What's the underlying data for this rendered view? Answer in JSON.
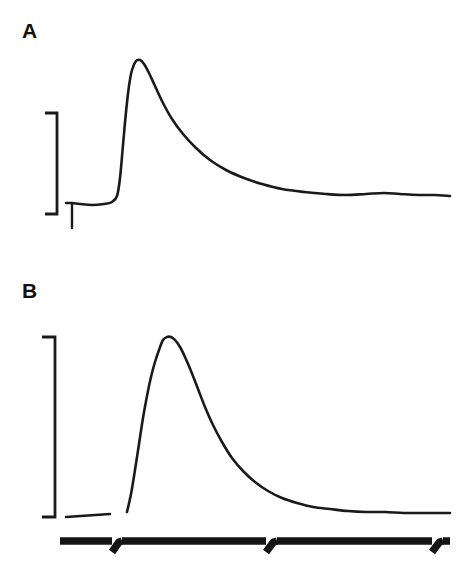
{
  "figure": {
    "background_color": "#ffffff",
    "ink_color": "#1a1a1a",
    "width": 469,
    "height": 575,
    "panel_a_label": "A",
    "panel_b_label": "B"
  },
  "chart_data": {
    "type": "line",
    "title": "",
    "subtitle": "",
    "xlabel": "",
    "ylabel": "",
    "grid": false,
    "legend_position": "none",
    "axis_visible": false,
    "xlim": [
      0,
      469
    ],
    "ylim": [
      0,
      575
    ],
    "panels": [
      {
        "name": "A",
        "label": "A",
        "label_x": 22,
        "label_y": 38,
        "baseline_y": 203,
        "peak_x": 137,
        "peak_y": 60,
        "rise_start_x": 118,
        "trace_start_x": 66,
        "trace_end_x": 450,
        "plateau_y": 197,
        "peak_amplitude_px": 143,
        "has_stimulus_artifact": true,
        "stimulus_artifact_x": 72,
        "stimulus_artifact_bottom_y": 228,
        "calibration_bracket": {
          "stem_x": 57,
          "top_y": 113,
          "bottom_y": 214,
          "tick_length": 12,
          "height_px": 101,
          "orientation": "right-facing"
        },
        "points": [
          [
            66,
            203
          ],
          [
            72,
            203
          ],
          [
            80,
            204
          ],
          [
            92,
            205
          ],
          [
            104,
            204
          ],
          [
            112,
            202
          ],
          [
            117,
            196
          ],
          [
            120,
            178
          ],
          [
            123,
            145
          ],
          [
            126,
            112
          ],
          [
            129,
            86
          ],
          [
            132,
            70
          ],
          [
            136,
            61
          ],
          [
            140,
            60
          ],
          [
            144,
            64
          ],
          [
            149,
            73
          ],
          [
            155,
            86
          ],
          [
            163,
            103
          ],
          [
            172,
            119
          ],
          [
            183,
            134
          ],
          [
            196,
            148
          ],
          [
            210,
            160
          ],
          [
            226,
            170
          ],
          [
            244,
            178
          ],
          [
            262,
            184
          ],
          [
            282,
            189
          ],
          [
            304,
            192
          ],
          [
            326,
            194
          ],
          [
            346,
            195
          ],
          [
            366,
            194
          ],
          [
            384,
            193
          ],
          [
            400,
            194
          ],
          [
            418,
            195
          ],
          [
            434,
            195
          ],
          [
            450,
            196
          ]
        ]
      },
      {
        "name": "B",
        "label": "B",
        "label_x": 22,
        "label_y": 298,
        "baseline_y": 515,
        "peak_x": 165,
        "peak_y": 337,
        "rise_start_x": 127,
        "trace_end_x": 450,
        "plateau_y": 512,
        "peak_amplitude_px": 178,
        "has_stimulus_artifact": false,
        "baseline_stub": {
          "start_x": 66,
          "start_y": 517,
          "end_x": 110,
          "end_y": 514
        },
        "calibration_bracket": {
          "stem_x": 55,
          "top_y": 337,
          "bottom_y": 517,
          "tick_length": 13,
          "height_px": 180,
          "orientation": "right-facing"
        },
        "points": [
          [
            127,
            512
          ],
          [
            131,
            494
          ],
          [
            135,
            470
          ],
          [
            139,
            444
          ],
          [
            143,
            418
          ],
          [
            147,
            396
          ],
          [
            151,
            377
          ],
          [
            155,
            362
          ],
          [
            159,
            350
          ],
          [
            163,
            340
          ],
          [
            167,
            337
          ],
          [
            171,
            337
          ],
          [
            175,
            340
          ],
          [
            180,
            347
          ],
          [
            185,
            357
          ],
          [
            191,
            371
          ],
          [
            198,
            389
          ],
          [
            205,
            407
          ],
          [
            213,
            425
          ],
          [
            222,
            442
          ],
          [
            232,
            458
          ],
          [
            243,
            471
          ],
          [
            255,
            482
          ],
          [
            268,
            491
          ],
          [
            282,
            498
          ],
          [
            297,
            503
          ],
          [
            313,
            507
          ],
          [
            330,
            509
          ],
          [
            348,
            511
          ],
          [
            366,
            512
          ],
          [
            385,
            512
          ],
          [
            404,
            513
          ],
          [
            424,
            513
          ],
          [
            440,
            513
          ],
          [
            450,
            513
          ]
        ]
      }
    ],
    "time_bar": {
      "y": 541,
      "start_x": 60,
      "end_x": 450,
      "thickness_px": 7.5,
      "break_count": 3,
      "segments": [
        {
          "from_x": 60,
          "to_x": 112
        },
        {
          "from_x": 122,
          "to_x": 266
        },
        {
          "from_x": 277,
          "to_x": 432
        },
        {
          "from_x": 443,
          "to_x": 450
        }
      ],
      "breaks": [
        {
          "x": 112,
          "hook_to_x": 122,
          "hook_bottom_y": 552
        },
        {
          "x": 266,
          "hook_to_x": 277,
          "hook_bottom_y": 552
        },
        {
          "x": 432,
          "hook_to_x": 443,
          "hook_bottom_y": 552
        }
      ]
    }
  }
}
